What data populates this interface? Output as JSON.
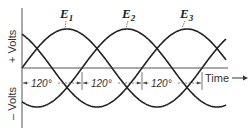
{
  "diagram": {
    "axis": {
      "y_positive_label": "+ Volts",
      "y_negative_label": "– Volts",
      "x_label": "Time",
      "x_arrow": "→"
    },
    "curves": [
      {
        "name": "E1",
        "label_main": "E",
        "label_sub": "1",
        "phase_deg": 0
      },
      {
        "name": "E2",
        "label_main": "E",
        "label_sub": "2",
        "phase_deg": 120
      },
      {
        "name": "E3",
        "label_main": "E",
        "label_sub": "3",
        "phase_deg": 240
      }
    ],
    "dimensions": [
      {
        "label": "120°"
      },
      {
        "label": "120°"
      },
      {
        "label": "120°"
      }
    ],
    "colors": {
      "line": "#222222",
      "axis": "#555555",
      "dash": "#666666"
    }
  }
}
